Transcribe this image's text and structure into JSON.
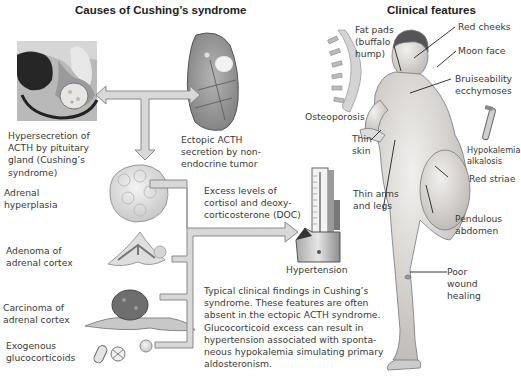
{
  "left_panel": {
    "title": "Causes of Cushing’s syndrome",
    "causes": {
      "pituitary": "Hypersecretion of\nACTH by pituitary\ngland (Cushing’s\nsyndrome)",
      "ectopic": "Ectopic ACTH\nsecretion by non-\nendocrine tumor",
      "hyperplasia": "Adrenal\nhyperplasia",
      "adenoma": "Adenoma of\nadrenal cortex",
      "carcinoma": "Carcinoma of\nadrenal cortex",
      "exogenous": "Exogenous\nglucocorticoids"
    },
    "excess_label": "Excess levels of\ncortisol and deoxy-\ncorticosterone (DOC)",
    "hypertension_label": "Hypertension",
    "caption": "Typical  clinical findings in Cushing’s\nsyndrome. These features are often\nabsent in the ectopic ACTH syndrome.\nGlucocorticoid excess can result in\nhypertension associated with sponta-\nneous hypokalemia simulating primary\naldosteronism."
  },
  "right_panel": {
    "title": "Clinical features",
    "features": {
      "osteoporosis": "Osteoporosis",
      "fat_pads": "Fat pads\n(buffalo\nhump)",
      "red_cheeks": "Red cheeks",
      "moon_face": "Moon face",
      "bruise": "Bruiseability\necchymoses",
      "thin_skin": "Thin\nskin",
      "hypokalemia": "Hypokalemia\nalkalosis",
      "red_striae": "Red striae",
      "thin_limbs": "Thin arms\nand legs",
      "pendulous": "Pendulous\nabdomen",
      "wound": "Poor\nwound\nhealing"
    }
  },
  "colors": {
    "arrow_fill": "#d8d8d8",
    "arrow_stroke": "#8a8a8a",
    "text": "#3a3a3a"
  }
}
